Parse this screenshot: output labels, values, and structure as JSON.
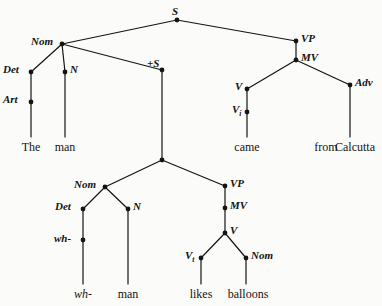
{
  "diagram": {
    "type": "syntax-tree",
    "background_color": "#fbfbf9",
    "ink_color": "#141414",
    "sentence": "The man wh- man likes balloons came from Calcutta",
    "nodes": [
      {
        "id": "S",
        "label": "S",
        "x": 177,
        "y": 20,
        "label_x": 172,
        "label_y": 6,
        "anchor": "center"
      },
      {
        "id": "Nom1",
        "label": "Nom",
        "x": 62,
        "y": 44,
        "label_x": 31,
        "label_y": 36,
        "anchor": "right"
      },
      {
        "id": "VP1",
        "label": "VP",
        "x": 296,
        "y": 41,
        "label_x": 301,
        "label_y": 33,
        "anchor": "left"
      },
      {
        "id": "Det1",
        "label": "Det",
        "x": 31,
        "y": 72,
        "label_x": 3,
        "label_y": 64,
        "anchor": "right"
      },
      {
        "id": "N1",
        "label": "N",
        "x": 65,
        "y": 72,
        "label_x": 70,
        "label_y": 64,
        "anchor": "left"
      },
      {
        "id": "plusS",
        "label": "+S",
        "x": 162,
        "y": 70,
        "label_x": 147,
        "label_y": 58,
        "anchor": "left"
      },
      {
        "id": "MV1",
        "label": "MV",
        "x": 296,
        "y": 60,
        "label_x": 301,
        "label_y": 52,
        "anchor": "left"
      },
      {
        "id": "Art1",
        "label": "Art",
        "x": 31,
        "y": 102,
        "label_x": 3,
        "label_y": 94,
        "anchor": "right"
      },
      {
        "id": "V1",
        "label": "V",
        "x": 247,
        "y": 89,
        "label_x": 235,
        "label_y": 81,
        "anchor": "right"
      },
      {
        "id": "Adv1",
        "label": "Adv",
        "x": 350,
        "y": 85,
        "label_x": 355,
        "label_y": 77,
        "anchor": "left"
      },
      {
        "id": "Vi1",
        "label": "V",
        "sub": "i",
        "x": 247,
        "y": 112,
        "label_x": 232,
        "label_y": 104,
        "anchor": "right"
      },
      {
        "id": "branch2",
        "label": "",
        "x": 162,
        "y": 160,
        "label_x": 0,
        "label_y": 0,
        "anchor": "none"
      },
      {
        "id": "Nom2",
        "label": "Nom",
        "x": 105,
        "y": 187,
        "label_x": 74,
        "label_y": 179,
        "anchor": "right"
      },
      {
        "id": "VP2",
        "label": "VP",
        "x": 225,
        "y": 186,
        "label_x": 230,
        "label_y": 178,
        "anchor": "left"
      },
      {
        "id": "Det2",
        "label": "Det",
        "x": 83,
        "y": 209,
        "label_x": 55,
        "label_y": 201,
        "anchor": "right"
      },
      {
        "id": "N2",
        "label": "N",
        "x": 128,
        "y": 209,
        "label_x": 133,
        "label_y": 201,
        "anchor": "left"
      },
      {
        "id": "MV2",
        "label": "MV",
        "x": 225,
        "y": 208,
        "label_x": 230,
        "label_y": 200,
        "anchor": "left"
      },
      {
        "id": "wh1",
        "label": "wh-",
        "x": 83,
        "y": 240,
        "label_x": 54,
        "label_y": 233,
        "anchor": "right"
      },
      {
        "id": "V2",
        "label": "V",
        "x": 225,
        "y": 233,
        "label_x": 230,
        "label_y": 225,
        "anchor": "left"
      },
      {
        "id": "Vt1",
        "label": "V",
        "sub": "t",
        "x": 201,
        "y": 258,
        "label_x": 185,
        "label_y": 250,
        "anchor": "right"
      },
      {
        "id": "Nom3",
        "label": "Nom",
        "x": 246,
        "y": 258,
        "label_x": 251,
        "label_y": 250,
        "anchor": "left"
      }
    ],
    "edges": [
      {
        "from": "S",
        "to": "Nom1",
        "x1": 177,
        "y1": 20,
        "x2": 62,
        "y2": 44
      },
      {
        "from": "S",
        "to": "VP1",
        "x1": 177,
        "y1": 20,
        "x2": 296,
        "y2": 41
      },
      {
        "from": "Nom1",
        "to": "Det1",
        "x1": 62,
        "y1": 44,
        "x2": 31,
        "y2": 72
      },
      {
        "from": "Nom1",
        "to": "N1",
        "x1": 62,
        "y1": 44,
        "x2": 65,
        "y2": 72
      },
      {
        "from": "Nom1",
        "to": "plusS",
        "x1": 62,
        "y1": 44,
        "x2": 162,
        "y2": 70
      },
      {
        "from": "Det1",
        "to": "Art1",
        "x1": 31,
        "y1": 72,
        "x2": 31,
        "y2": 102
      },
      {
        "from": "Art1",
        "to": "the",
        "x1": 31,
        "y1": 102,
        "x2": 31,
        "y2": 137
      },
      {
        "from": "N1",
        "to": "man1",
        "x1": 65,
        "y1": 72,
        "x2": 65,
        "y2": 137
      },
      {
        "from": "plusS",
        "to": "branch2",
        "x1": 162,
        "y1": 70,
        "x2": 162,
        "y2": 160
      },
      {
        "from": "VP1",
        "to": "MV1",
        "x1": 296,
        "y1": 41,
        "x2": 296,
        "y2": 60
      },
      {
        "from": "MV1",
        "to": "V1",
        "x1": 296,
        "y1": 60,
        "x2": 247,
        "y2": 89
      },
      {
        "from": "MV1",
        "to": "Adv1",
        "x1": 296,
        "y1": 60,
        "x2": 350,
        "y2": 85
      },
      {
        "from": "V1",
        "to": "Vi1",
        "x1": 247,
        "y1": 89,
        "x2": 247,
        "y2": 112
      },
      {
        "from": "Vi1",
        "to": "came",
        "x1": 247,
        "y1": 112,
        "x2": 247,
        "y2": 137
      },
      {
        "from": "Adv1",
        "to": "fromcal",
        "x1": 350,
        "y1": 85,
        "x2": 350,
        "y2": 137
      },
      {
        "from": "branch2",
        "to": "Nom2",
        "x1": 162,
        "y1": 160,
        "x2": 105,
        "y2": 187
      },
      {
        "from": "branch2",
        "to": "VP2",
        "x1": 162,
        "y1": 160,
        "x2": 225,
        "y2": 186
      },
      {
        "from": "Nom2",
        "to": "Det2",
        "x1": 105,
        "y1": 187,
        "x2": 83,
        "y2": 209
      },
      {
        "from": "Nom2",
        "to": "N2",
        "x1": 105,
        "y1": 187,
        "x2": 128,
        "y2": 209
      },
      {
        "from": "Det2",
        "to": "wh1",
        "x1": 83,
        "y1": 209,
        "x2": 83,
        "y2": 240
      },
      {
        "from": "wh1",
        "to": "whterm",
        "x1": 83,
        "y1": 240,
        "x2": 83,
        "y2": 284
      },
      {
        "from": "N2",
        "to": "man2",
        "x1": 128,
        "y1": 209,
        "x2": 128,
        "y2": 284
      },
      {
        "from": "VP2",
        "to": "MV2",
        "x1": 225,
        "y1": 186,
        "x2": 225,
        "y2": 208
      },
      {
        "from": "MV2",
        "to": "V2",
        "x1": 225,
        "y1": 208,
        "x2": 225,
        "y2": 233
      },
      {
        "from": "V2",
        "to": "Vt1",
        "x1": 225,
        "y1": 233,
        "x2": 201,
        "y2": 258
      },
      {
        "from": "V2",
        "to": "Nom3",
        "x1": 225,
        "y1": 233,
        "x2": 246,
        "y2": 258
      },
      {
        "from": "Vt1",
        "to": "likes",
        "x1": 201,
        "y1": 258,
        "x2": 201,
        "y2": 284
      },
      {
        "from": "Nom3",
        "to": "balloons",
        "x1": 246,
        "y1": 258,
        "x2": 246,
        "y2": 284
      }
    ],
    "terminals": [
      {
        "id": "the",
        "text": "The",
        "x": 31,
        "y": 141,
        "italic": false
      },
      {
        "id": "man1",
        "text": "man",
        "x": 65,
        "y": 141,
        "italic": false
      },
      {
        "id": "came",
        "text": "came",
        "x": 247,
        "y": 141,
        "italic": false
      },
      {
        "id": "from",
        "text": "from",
        "x": 326,
        "y": 141,
        "italic": false
      },
      {
        "id": "calcutta",
        "text": "Calcutta",
        "x": 355,
        "y": 141,
        "italic": false
      },
      {
        "id": "whterm",
        "text": "wh-",
        "x": 83,
        "y": 288,
        "italic": true
      },
      {
        "id": "man2",
        "text": "man",
        "x": 128,
        "y": 288,
        "italic": false
      },
      {
        "id": "likes",
        "text": "likes",
        "x": 201,
        "y": 288,
        "italic": false
      },
      {
        "id": "balloons",
        "text": "balloons",
        "x": 248,
        "y": 288,
        "italic": false
      }
    ]
  }
}
